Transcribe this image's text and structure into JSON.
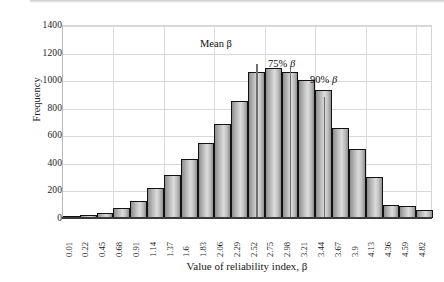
{
  "chart_data": {
    "type": "bar",
    "title": "",
    "xlabel": "Value of reliability index, β",
    "ylabel": "Frequency",
    "ylim": [
      0,
      1400
    ],
    "ytick_step": 200,
    "yticks": [
      "1400",
      "1200",
      "1000",
      "800",
      "600",
      "400",
      "200",
      "0"
    ],
    "grid": true,
    "legend": "none",
    "categories": [
      "0.01",
      "0.22",
      "0.45",
      "0.68",
      "0.91",
      "1.14",
      "1.37",
      "1.6",
      "1.83",
      "2.06",
      "2.29",
      "2.52",
      "2.75",
      "2.98",
      "3.21",
      "3.44",
      "3.67",
      "3.9",
      "4.13",
      "4.36",
      "4.59",
      "4.82"
    ],
    "values": [
      5,
      20,
      40,
      75,
      125,
      215,
      310,
      425,
      545,
      680,
      850,
      1060,
      1085,
      1060,
      1000,
      930,
      650,
      500,
      300,
      95,
      90,
      55
    ],
    "annotations": [
      {
        "id": "mean",
        "label_plain": "Mean ",
        "label_symbol": "β",
        "category": "2.52",
        "marker_top_value": 1125
      },
      {
        "id": "p75",
        "label_plain": "75% ",
        "label_symbol": "β",
        "category": "2.98",
        "marker_top_value": 1085
      },
      {
        "id": "p90",
        "label_plain": "90% ",
        "label_symbol": "β",
        "category": "3.44",
        "marker_top_value": 885
      }
    ]
  },
  "colors": {
    "bar_fill_light": "#dcdcdc",
    "bar_fill_dark": "#8a8a8a",
    "bar_border": "#121212",
    "grid": "#d9d9d9",
    "axis": "#3a3a3a",
    "marker": "#6f6f6f",
    "text": "#1a1a1a"
  }
}
